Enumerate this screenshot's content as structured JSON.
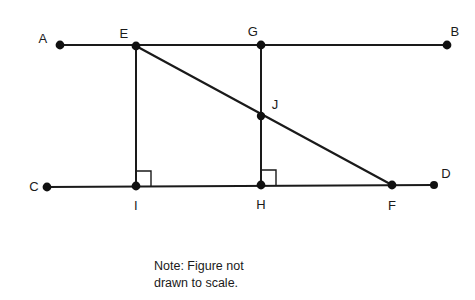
{
  "figure": {
    "type": "geometry-diagram",
    "stroke_color": "#1a1a1a",
    "background_color": "#ffffff",
    "points": [
      {
        "id": "A",
        "label": "A",
        "x": 60,
        "y": 45,
        "label_x": 43,
        "label_y": 38
      },
      {
        "id": "E",
        "label": "E",
        "x": 136,
        "y": 46,
        "label_x": 124,
        "label_y": 33
      },
      {
        "id": "G",
        "label": "G",
        "x": 261,
        "y": 45,
        "label_x": 253,
        "label_y": 31
      },
      {
        "id": "B",
        "label": "B",
        "x": 447,
        "y": 45,
        "label_x": 455,
        "label_y": 31
      },
      {
        "id": "J",
        "label": "J",
        "x": 261,
        "y": 116,
        "label_x": 275,
        "label_y": 104
      },
      {
        "id": "C",
        "label": "C",
        "x": 47,
        "y": 187,
        "label_x": 34,
        "label_y": 186
      },
      {
        "id": "I",
        "label": "I",
        "x": 136,
        "y": 186,
        "label_x": 136,
        "label_y": 205
      },
      {
        "id": "H",
        "label": "H",
        "x": 261,
        "y": 185,
        "label_x": 261,
        "label_y": 204
      },
      {
        "id": "F",
        "label": "F",
        "x": 392,
        "y": 185,
        "label_x": 392,
        "label_y": 205
      },
      {
        "id": "D",
        "label": "D",
        "x": 434,
        "y": 185,
        "label_x": 446,
        "label_y": 173
      }
    ],
    "segments": [
      {
        "id": "AB",
        "name": "line-ab",
        "x1": 60,
        "y1": 45,
        "x2": 447,
        "y2": 45
      },
      {
        "id": "CD",
        "name": "line-cd",
        "x1": 47,
        "y1": 187,
        "x2": 434,
        "y2": 185
      },
      {
        "id": "EF",
        "name": "transversal-ef",
        "x1": 136,
        "y1": 46,
        "x2": 392,
        "y2": 185
      },
      {
        "id": "EI",
        "name": "perpendicular-ei",
        "x1": 136,
        "y1": 46,
        "x2": 136,
        "y2": 186
      },
      {
        "id": "GH",
        "name": "perpendicular-gh",
        "x1": 261,
        "y1": 45,
        "x2": 261,
        "y2": 185
      }
    ],
    "right_angles": [
      {
        "id": "angle-at-I",
        "vertex": "I",
        "x": 136,
        "y": 186,
        "size": 15
      },
      {
        "id": "angle-at-H",
        "vertex": "H",
        "x": 261,
        "y": 185,
        "size": 15
      }
    ],
    "dot_radius": 4.4
  },
  "note": {
    "line1": "Note: Figure not",
    "line2": "drawn to scale."
  }
}
